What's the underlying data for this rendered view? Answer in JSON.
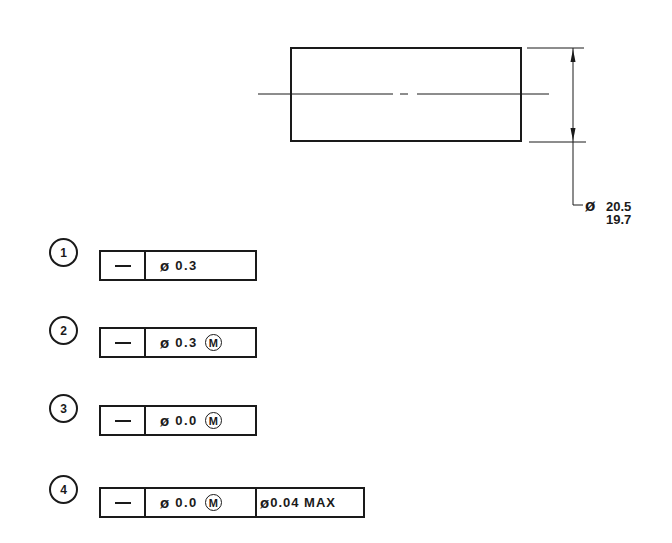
{
  "drawing": {
    "part": {
      "shape": "cylinder-side-view",
      "rect": {
        "x": 291,
        "y": 48,
        "width": 230,
        "height": 93
      }
    },
    "centerline": {
      "y": 94,
      "x_start": 258,
      "x_end": 549
    },
    "dimension": {
      "symbol": "ø",
      "upper_limit": "20.5",
      "lower_limit": "19.7"
    }
  },
  "feature_control_frames": [
    {
      "index": "1",
      "characteristic": "straightness",
      "symbol": "—",
      "diameter_symbol": "ø",
      "tolerance": "0.3",
      "modifier": null,
      "extra": null
    },
    {
      "index": "2",
      "characteristic": "straightness",
      "symbol": "—",
      "diameter_symbol": "ø",
      "tolerance": "0.3",
      "modifier": "M",
      "extra": null
    },
    {
      "index": "3",
      "characteristic": "straightness",
      "symbol": "—",
      "diameter_symbol": "ø",
      "tolerance": "0.0",
      "modifier": "M",
      "extra": null
    },
    {
      "index": "4",
      "characteristic": "straightness",
      "symbol": "—",
      "diameter_symbol": "ø",
      "tolerance": "0.0",
      "modifier": "M",
      "extra": {
        "diameter_symbol": "ø",
        "value": "0.04 MAX"
      }
    }
  ],
  "colors": {
    "ink": "#1a1a1a",
    "background": "#ffffff"
  }
}
